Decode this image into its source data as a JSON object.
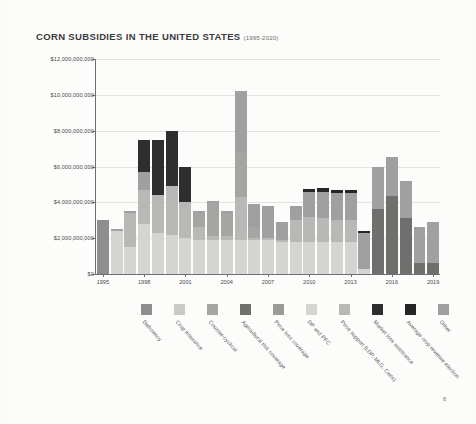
{
  "document": {
    "page_number": "8"
  },
  "header": {
    "title": "CORN SUBSIDIES IN THE UNITED STATES",
    "subtitle": "(1995-2020)"
  },
  "chart_data": {
    "type": "bar",
    "stacked": true,
    "title": "CORN SUBSIDIES IN THE UNITED STATES",
    "subtitle": "(1995-2020)",
    "xlabel": "",
    "ylabel": "",
    "ylim": [
      0,
      12000000000
    ],
    "grid": true,
    "legend_position": "bottom",
    "ytick_labels": [
      "$0",
      "$2,000,000,000",
      "$4,000,000,000",
      "$6,000,000,000",
      "$8,000,000,000",
      "$10,000,000,000",
      "$12,000,000,000"
    ],
    "ytick_values": [
      0,
      2000000000,
      4000000000,
      6000000000,
      8000000000,
      10000000000,
      12000000000
    ],
    "categories": [
      "1995",
      "1996",
      "1997",
      "1998",
      "1999",
      "2000",
      "2001",
      "2002",
      "2003",
      "2004",
      "2005",
      "2006",
      "2007",
      "2008",
      "2009",
      "2010",
      "2011",
      "2012",
      "2013",
      "2014",
      "2015",
      "2016",
      "2017",
      "2018",
      "2019"
    ],
    "xtick_labels": [
      "1995",
      "1998",
      "2001",
      "2004",
      "2007",
      "2010",
      "2013",
      "2016",
      "2019"
    ],
    "series": [
      {
        "name": "Deficiency",
        "color": "#8e8e8e",
        "values": [
          3000000000,
          0,
          0,
          0,
          0,
          0,
          0,
          0,
          0,
          0,
          0,
          0,
          0,
          0,
          0,
          0,
          0,
          0,
          0,
          0,
          0,
          0,
          0,
          0,
          0
        ]
      },
      {
        "name": "Crop insurance",
        "color": "#c9c9c7",
        "values": [
          0,
          0,
          0,
          0,
          0,
          0,
          0,
          0,
          0,
          0,
          0,
          0,
          0,
          0,
          0,
          0,
          0,
          0,
          0,
          0,
          0,
          0,
          0,
          0,
          0
        ]
      },
      {
        "name": "Counter-cyclical",
        "color": "#a5a5a3",
        "values": [
          0,
          0,
          0,
          0,
          0,
          0,
          0,
          800000000,
          1900000000,
          1300000000,
          2500000000,
          600000000,
          0,
          0,
          0,
          0,
          0,
          0,
          0,
          0,
          0,
          0,
          0,
          0,
          0
        ]
      },
      {
        "name": "Agricultural risk coverage",
        "color": "#6f6f6e",
        "values": [
          0,
          0,
          0,
          0,
          0,
          0,
          0,
          0,
          0,
          0,
          0,
          0,
          0,
          0,
          0,
          0,
          0,
          0,
          0,
          0,
          3650000000,
          4350000000,
          3100000000,
          600000000,
          600000000
        ]
      },
      {
        "name": "Price loss coverage",
        "color": "#9a9a98",
        "values": [
          0,
          0,
          0,
          0,
          0,
          0,
          0,
          0,
          0,
          0,
          0,
          0,
          0,
          0,
          0,
          0,
          0,
          0,
          0,
          0,
          0,
          0,
          0,
          0,
          0
        ]
      },
      {
        "name": "DP and PFC",
        "color": "#d4d4d2",
        "values": [
          0,
          2400000000,
          1500000000,
          2800000000,
          2300000000,
          2200000000,
          2000000000,
          1900000000,
          1900000000,
          1900000000,
          1900000000,
          1900000000,
          1900000000,
          1800000000,
          1800000000,
          1800000000,
          1800000000,
          1800000000,
          1800000000,
          300000000,
          0,
          0,
          0,
          0,
          0
        ]
      },
      {
        "name": "Price support (LDP, MLG, Certs)",
        "color": "#b8b8b6",
        "values": [
          0,
          0,
          1900000000,
          1900000000,
          2100000000,
          2700000000,
          2000000000,
          700000000,
          200000000,
          200000000,
          2400000000,
          100000000,
          100000000,
          100000000,
          1200000000,
          1400000000,
          1300000000,
          1200000000,
          1200000000,
          0,
          0,
          0,
          0,
          0,
          0
        ]
      },
      {
        "name": "Market loss assistance",
        "color": "#2e2e2e",
        "values": [
          0,
          0,
          0,
          1800000000,
          3100000000,
          3100000000,
          2000000000,
          0,
          0,
          0,
          0,
          0,
          0,
          0,
          0,
          0,
          0,
          0,
          0,
          0,
          0,
          0,
          0,
          0,
          0
        ]
      },
      {
        "name": "Average crop revenue election",
        "color": "#262626",
        "values": [
          0,
          0,
          0,
          0,
          0,
          0,
          0,
          0,
          0,
          0,
          0,
          0,
          0,
          0,
          0,
          150000000,
          200000000,
          200000000,
          200000000,
          100000000,
          0,
          0,
          0,
          0,
          0
        ]
      },
      {
        "name": "Other",
        "color": "#a0a0a0",
        "values": [
          0,
          100000000,
          100000000,
          1000000000,
          0,
          0,
          0,
          100000000,
          100000000,
          100000000,
          3400000000,
          1300000000,
          1800000000,
          1000000000,
          800000000,
          1400000000,
          1500000000,
          1500000000,
          1500000000,
          2000000000,
          2300000000,
          2200000000,
          2100000000,
          2000000000,
          2300000000
        ]
      }
    ],
    "totals": [
      3000000000,
      2500000000,
      3500000000,
      7500000000,
      7500000000,
      8000000000,
      6000000000,
      3500000000,
      4100000000,
      3500000000,
      10200000000,
      3900000000,
      3800000000,
      2900000000,
      3800000000,
      4750000000,
      4800000000,
      4700000000,
      4700000000,
      2400000000,
      5950000000,
      6550000000,
      5200000000,
      2600000000,
      2900000000
    ]
  }
}
